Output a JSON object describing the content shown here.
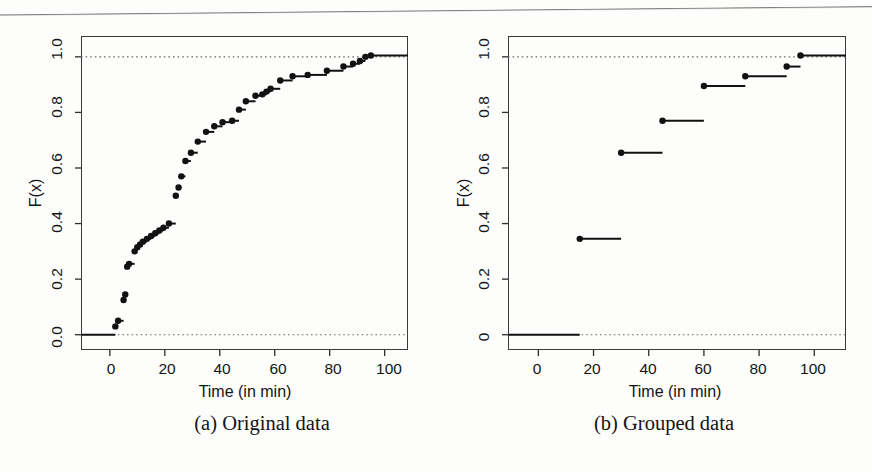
{
  "figure": {
    "background_color": "#fdfdfc",
    "ink_color": "#1a1a1a",
    "scan_rule": {
      "visible": true,
      "color": "#6a6a6d"
    }
  },
  "panels": [
    {
      "id": "panel-a",
      "caption": "(a) Original data",
      "caption_x": 262,
      "caption_y": 424,
      "frame": {
        "left": 81,
        "top": 36,
        "width": 327,
        "height": 314
      },
      "axes": {
        "xlabel": "Time (in min)",
        "ylabel": "F(x)",
        "xticks": [
          0,
          20,
          40,
          60,
          80,
          100
        ],
        "xtick_labels": [
          "0",
          "20",
          "40",
          "60",
          "80",
          "100"
        ],
        "yticks": [
          0.0,
          0.2,
          0.4,
          0.6,
          0.8,
          1.0
        ],
        "ytick_labels": [
          "0.0",
          "0.2",
          "0.4",
          "0.6",
          "0.8",
          "1.0"
        ],
        "xlim": [
          -10.5,
          108.5
        ],
        "ylim": [
          -0.055,
          1.075
        ],
        "grid": false,
        "reference_lines": [
          0.0,
          1.0
        ]
      }
    },
    {
      "id": "panel-b",
      "caption": "(b) Grouped data",
      "caption_x": 664,
      "caption_y": 424,
      "frame": {
        "left": 508,
        "top": 36,
        "width": 338,
        "height": 314
      },
      "axes": {
        "xlabel": "Time (in min)",
        "ylabel": "F(x)",
        "xticks": [
          0,
          20,
          40,
          60,
          80,
          100
        ],
        "xtick_labels": [
          "0",
          "20",
          "40",
          "60",
          "80",
          "100"
        ],
        "yticks": [
          0.0,
          0.2,
          0.4,
          0.6,
          0.8,
          1.0
        ],
        "ytick_labels": [
          "0",
          "0.2",
          "0.4",
          "0.6",
          "0.8",
          "1.0"
        ],
        "xlim": [
          -11.0,
          111.5
        ],
        "ylim": [
          -0.055,
          1.075
        ],
        "grid": false,
        "reference_lines": [
          0.0,
          1.0
        ]
      }
    }
  ],
  "chart_data": [
    {
      "type": "line",
      "subtype": "empirical-cdf-step",
      "title": "(a) Original data",
      "xlabel": "Time (in min)",
      "ylabel": "F(x)",
      "xlim": [
        -10.5,
        108.5
      ],
      "ylim": [
        -0.055,
        1.075
      ],
      "xticks": [
        0,
        20,
        40,
        60,
        80,
        100
      ],
      "yticks": [
        0.0,
        0.2,
        0.4,
        0.6,
        0.8,
        1.0
      ],
      "grid": false,
      "legend": null,
      "marker": "filled-circle",
      "reference_lines": [
        {
          "y": 0.0,
          "style": "dotted"
        },
        {
          "y": 1.0,
          "style": "dotted"
        }
      ],
      "series": [
        {
          "name": "Empirical CDF of original data",
          "x": [
            2.0,
            3.0,
            5.0,
            5.6,
            6.3,
            7.0,
            9.0,
            10.0,
            11.0,
            12.0,
            13.5,
            15.0,
            16.5,
            18.0,
            19.5,
            21.5,
            24.0,
            25.0,
            26.0,
            27.5,
            29.5,
            32.0,
            35.0,
            38.0,
            41.0,
            44.5,
            47.0,
            49.5,
            53.0,
            55.5,
            57.0,
            58.5,
            62.0,
            66.5,
            72.0,
            79.0,
            85.0,
            88.5,
            91.0,
            93.0,
            95.0
          ],
          "y": [
            0.03,
            0.05,
            0.125,
            0.145,
            0.245,
            0.255,
            0.3,
            0.315,
            0.325,
            0.335,
            0.345,
            0.355,
            0.365,
            0.375,
            0.385,
            0.4,
            0.5,
            0.53,
            0.57,
            0.625,
            0.655,
            0.695,
            0.73,
            0.75,
            0.765,
            0.77,
            0.81,
            0.84,
            0.86,
            0.865,
            0.875,
            0.885,
            0.915,
            0.93,
            0.935,
            0.95,
            0.965,
            0.975,
            0.985,
            1.0,
            1.005
          ]
        }
      ],
      "step_start_x": -10.5,
      "step_end_x": 108.5
    },
    {
      "type": "line",
      "subtype": "empirical-cdf-step",
      "title": "(b) Grouped data",
      "xlabel": "Time (in min)",
      "ylabel": "F(x)",
      "xlim": [
        -11.0,
        111.5
      ],
      "ylim": [
        -0.055,
        1.075
      ],
      "xticks": [
        0,
        20,
        40,
        60,
        80,
        100
      ],
      "yticks": [
        0.0,
        0.2,
        0.4,
        0.6,
        0.8,
        1.0
      ],
      "grid": false,
      "legend": null,
      "marker": "filled-circle",
      "reference_lines": [
        {
          "y": 0.0,
          "style": "dotted"
        },
        {
          "y": 1.0,
          "style": "dotted"
        }
      ],
      "series": [
        {
          "name": "Empirical CDF of grouped data",
          "x": [
            15,
            30,
            45,
            60,
            75,
            90,
            95
          ],
          "y": [
            0.345,
            0.655,
            0.77,
            0.895,
            0.93,
            0.965,
            1.005
          ]
        }
      ],
      "baseline": {
        "y": 0.0,
        "x_from": -11.0,
        "x_to": 15
      },
      "step_end_x": 111.5
    }
  ]
}
